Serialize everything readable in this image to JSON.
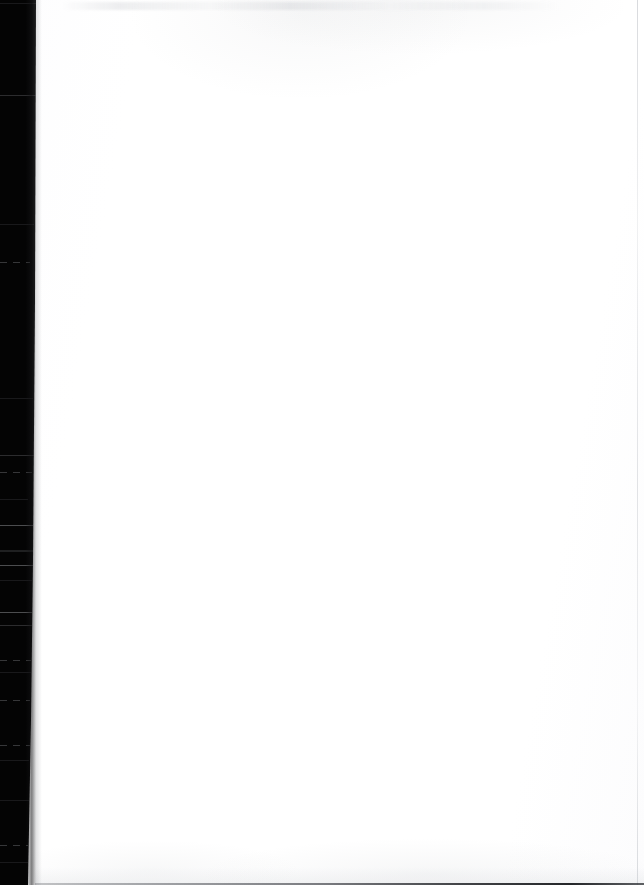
{
  "document": {
    "kind": "scanned-page",
    "title": "Blank scanned page",
    "page_label": "",
    "body_text": "",
    "text_blocks": [],
    "has_visible_text": false
  },
  "canvas": {
    "width_px": 644,
    "height_px": 885,
    "paper_color": "#ffffff",
    "background_color": "#ffffff"
  },
  "artifacts": {
    "gutter": {
      "name": "binding-gutter-shadow",
      "edge": "left",
      "color": "#040404",
      "top_width_px": 36,
      "bottom_width_px": 28
    },
    "top_smudge": {
      "name": "top-edge-smudge",
      "color": "#aeb2b8",
      "y_px": 4,
      "height_px": 8
    },
    "right_trim_line": {
      "name": "right-trim-line",
      "color": "#bfc2c8",
      "x_px": 637,
      "width_px": 1
    },
    "bottom_trim_line": {
      "name": "bottom-trim-line",
      "color": "#1b1d20",
      "y_px": 883,
      "height_px": 2
    },
    "scan_streaks": {
      "name": "gutter-scan-streaks",
      "color": "#96989e",
      "rows_y_px": [
        3,
        95,
        224,
        262,
        398,
        455,
        472,
        499,
        525,
        550,
        565,
        580,
        612,
        625,
        660,
        672,
        700,
        745,
        760,
        800,
        845,
        862
      ]
    }
  }
}
